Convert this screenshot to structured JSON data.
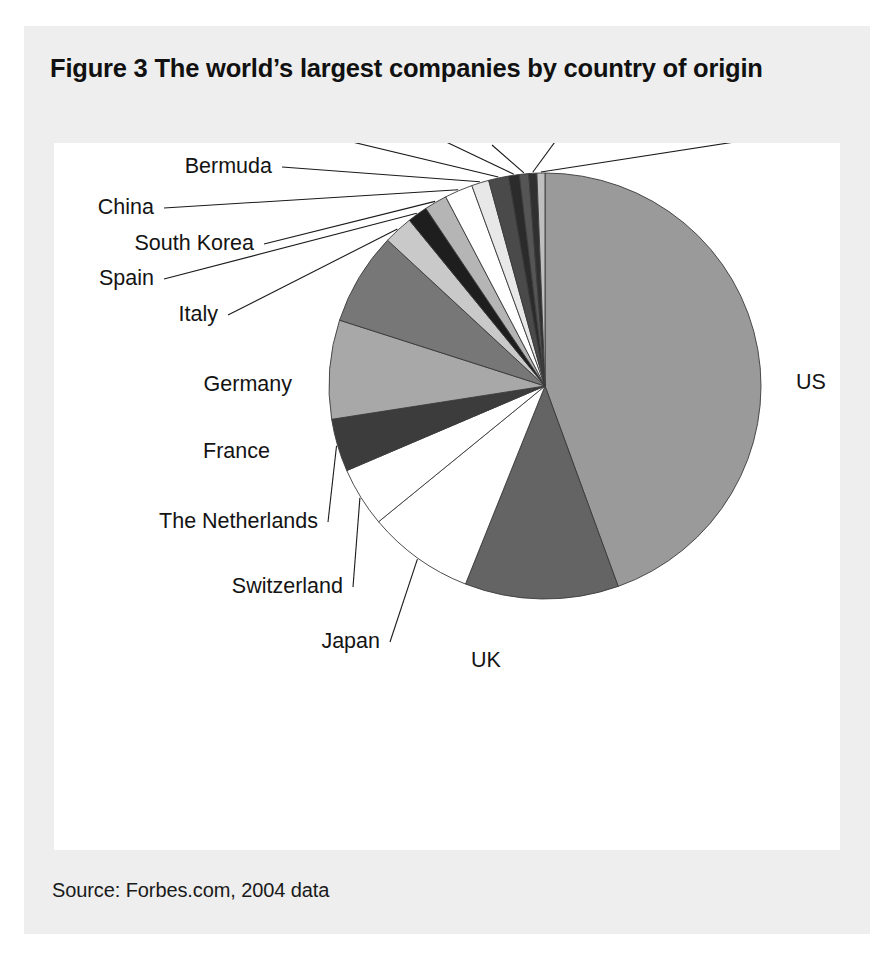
{
  "figure": {
    "title": "Figure 3 The world’s largest companies by country of origin",
    "source": "Source: Forbes.com, 2004 data"
  },
  "chart_data": {
    "type": "pie",
    "title": "Figure 3 The world’s largest companies by country of origin",
    "xlabel": "",
    "ylabel": "",
    "legend_position": "none",
    "grid": false,
    "note": "Share of the world’s largest companies by country of origin; slices ordered clockwise from 12 o’clock.",
    "start_angle_deg": 0,
    "direction": "clockwise",
    "categories": [
      "US",
      "UK",
      "Japan",
      "Switzerland",
      "The Netherlands",
      "France",
      "Germany",
      "Italy",
      "Spain",
      "South Korea",
      "China",
      "Bermuda",
      "Canada",
      "Finland",
      "Australia",
      "Russia",
      "Belgium"
    ],
    "values": [
      44.5,
      11.5,
      8.0,
      4.5,
      4.0,
      7.5,
      7.0,
      2.2,
      1.5,
      1.7,
      2.1,
      1.3,
      1.5,
      0.8,
      0.7,
      0.6,
      0.6
    ],
    "units": "percent",
    "slices": [
      {
        "label": "US",
        "value": 44.5,
        "color": "#9a9a9a",
        "label_x": 742,
        "label_y": 246,
        "anchor": "start",
        "leader": false
      },
      {
        "label": "UK",
        "value": 11.5,
        "color": "#646464",
        "label_x": 432,
        "label_y": 524,
        "anchor": "middle",
        "leader": false
      },
      {
        "label": "Japan",
        "value": 8.0,
        "color": "#ffffff",
        "label_x": 326,
        "label_y": 505,
        "anchor": "end",
        "leader": true
      },
      {
        "label": "Switzerland",
        "value": 4.5,
        "color": "#ffffff",
        "label_x": 289,
        "label_y": 450,
        "anchor": "end",
        "leader": true
      },
      {
        "label": "The Netherlands",
        "value": 4.0,
        "color": "#3c3c3c",
        "label_x": 264,
        "label_y": 385,
        "anchor": "end",
        "leader": true
      },
      {
        "label": "France",
        "value": 7.5,
        "color": "#a8a8a8",
        "label_x": 216,
        "label_y": 315,
        "anchor": "end",
        "leader": false
      },
      {
        "label": "Germany",
        "value": 7.0,
        "color": "#777777",
        "label_x": 238,
        "label_y": 248,
        "anchor": "end",
        "leader": false
      },
      {
        "label": "Italy",
        "value": 2.2,
        "color": "#c9c9c9",
        "label_x": 164,
        "label_y": 178,
        "anchor": "end",
        "leader": true
      },
      {
        "label": "Spain",
        "value": 1.5,
        "color": "#1e1e1e",
        "label_x": 100,
        "label_y": 142,
        "anchor": "end",
        "leader": true
      },
      {
        "label": "South Korea",
        "value": 1.7,
        "color": "#b5b5b5",
        "label_x": 200,
        "label_y": 107,
        "anchor": "end",
        "leader": true
      },
      {
        "label": "China",
        "value": 2.1,
        "color": "#ffffff",
        "label_x": 100,
        "label_y": 71,
        "anchor": "end",
        "leader": true
      },
      {
        "label": "Bermuda",
        "value": 1.3,
        "color": "#e8e8e8",
        "label_x": 218,
        "label_y": 30,
        "anchor": "end",
        "leader": true
      },
      {
        "label": "Canada",
        "value": 1.5,
        "color": "#4a4a4a",
        "label_x": 213,
        "label_y": -13,
        "anchor": "end",
        "leader": true
      },
      {
        "label": "Finland",
        "value": 0.8,
        "color": "#2b2b2b",
        "label_x": 325,
        "label_y": -43,
        "anchor": "middle",
        "leader": true
      },
      {
        "label": "Australia",
        "value": 0.7,
        "color": "#555555",
        "label_x": 438,
        "label_y": -8,
        "anchor": "middle",
        "leader": true
      },
      {
        "label": "Russia",
        "value": 0.6,
        "color": "#303030",
        "label_x": 525,
        "label_y": -44,
        "anchor": "middle",
        "leader": true
      },
      {
        "label": "Belgium",
        "value": 0.6,
        "color": "#bfbfbf",
        "label_x": 700,
        "label_y": -14,
        "anchor": "middle",
        "leader": true
      }
    ],
    "geometry": {
      "cx": 491,
      "cy": 243,
      "rx": 216,
      "ry": 213
    },
    "colors": {
      "stroke": "#3a3a3a",
      "leader": "#1a1a1a",
      "text": "#141414",
      "card_bg": "#eeeeee",
      "plot_bg": "#ffffff"
    }
  }
}
